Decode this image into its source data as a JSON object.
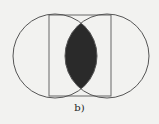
{
  "figure": {
    "caption": "b)",
    "colors": {
      "background": "#f2f2f0",
      "stroke": "#555555",
      "fill_intersection": "#2a2a2a"
    },
    "shapes": {
      "left_circle": {
        "cx": 55,
        "cy": 56,
        "r": 42
      },
      "right_circle": {
        "cx": 107,
        "cy": 56,
        "r": 42
      },
      "rectangle": {
        "x": 49,
        "y": 15,
        "width": 62,
        "height": 81
      }
    },
    "shaded_region": "intersection of left circle and right circle"
  }
}
